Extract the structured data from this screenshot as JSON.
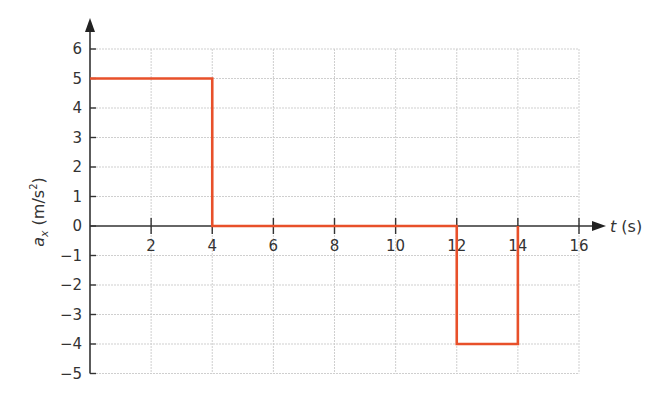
{
  "chart_data": {
    "type": "line",
    "title": "",
    "xlabel": "t (s)",
    "ylabel": "a_x (m/s^2)",
    "xlim": [
      0,
      16
    ],
    "ylim": [
      -5,
      6
    ],
    "grid": true,
    "x_ticks": [
      2,
      4,
      6,
      8,
      10,
      12,
      14,
      16
    ],
    "y_ticks": [
      -5,
      -4,
      -3,
      -2,
      -1,
      0,
      1,
      2,
      3,
      4,
      5,
      6
    ],
    "series": [
      {
        "name": "a_x",
        "color": "#e8502a",
        "step": true,
        "x": [
          0,
          4,
          4,
          12,
          12,
          14,
          14
        ],
        "y": [
          5,
          5,
          0,
          0,
          -4,
          -4,
          0
        ]
      }
    ]
  },
  "labels": {
    "x_axis_var": "t",
    "x_axis_unit": " (s)",
    "y_axis_var": "a",
    "y_axis_sub": "x",
    "y_axis_unit_open": " (m/s",
    "y_axis_unit_sup": "2",
    "y_axis_unit_close": ")"
  }
}
